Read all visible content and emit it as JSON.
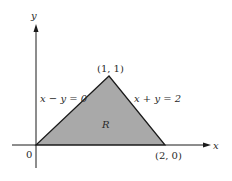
{
  "figure": {
    "axes": {
      "x_label": "x",
      "y_label": "y",
      "origin_label": "0"
    },
    "region": {
      "label": "R",
      "fill_color": "#a9a9a9",
      "vertices": [
        [
          0,
          0
        ],
        [
          1,
          1
        ],
        [
          2,
          0
        ]
      ]
    },
    "points": {
      "apex": "(1, 1)",
      "right": "(2, 0)"
    },
    "lines": {
      "left": "x − y = 0",
      "right": "x + y = 2"
    }
  }
}
